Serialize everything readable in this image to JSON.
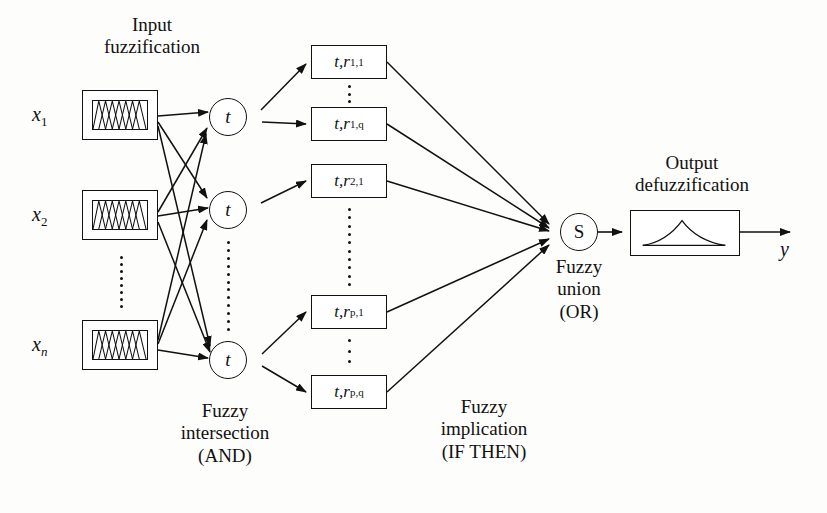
{
  "headings": {
    "input": "Input\nfuzzification",
    "input_line1": "Input",
    "input_line2": "fuzzification",
    "output_line1": "Output",
    "output_line2": "defuzzification"
  },
  "captions": {
    "intersection_line1": "Fuzzy",
    "intersection_line2": "intersection",
    "intersection_line3": "(AND)",
    "implication_line1": "Fuzzy",
    "implication_line2": "implication",
    "implication_line3": "(IF THEN)",
    "union_line1": "Fuzzy",
    "union_line2": "union",
    "union_line3": "(OR)"
  },
  "inputs": [
    {
      "id": "x1",
      "base": "x",
      "sub": "1",
      "sub_italic": false
    },
    {
      "id": "x2",
      "base": "x",
      "sub": "2",
      "sub_italic": false
    },
    {
      "id": "xn",
      "base": "x",
      "sub": "n",
      "sub_italic": true
    }
  ],
  "tnodes": [
    {
      "id": "t1",
      "label": "t"
    },
    {
      "id": "t2",
      "label": "t"
    },
    {
      "id": "t3",
      "label": "t"
    }
  ],
  "union_node": {
    "id": "s",
    "label": "S"
  },
  "rules": [
    {
      "id": "r11",
      "prefix": "t, ",
      "base": "r",
      "sub": "1,1"
    },
    {
      "id": "r1q",
      "prefix": "t, ",
      "base": "r",
      "sub": "1,q"
    },
    {
      "id": "r21",
      "prefix": "t, ",
      "base": "r",
      "sub": "2,1"
    },
    {
      "id": "rp1",
      "prefix": "t, ",
      "base": "r",
      "sub": "p,1"
    },
    {
      "id": "rpq",
      "prefix": "t, ",
      "base": "r",
      "sub": "p,q"
    }
  ],
  "output": {
    "variable": "y",
    "shape": "membership-peak-curve"
  },
  "colors": {
    "ink": "#111111",
    "paper": "#fdfdfb"
  }
}
